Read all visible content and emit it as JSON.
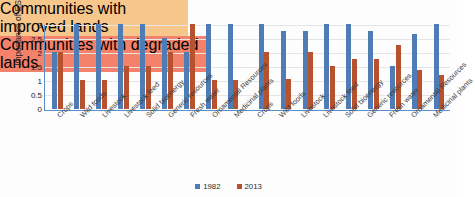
{
  "chart_data": {
    "type": "bar",
    "title": "",
    "xlabel": "",
    "ylabel": "Importance of ES",
    "ylim": [
      0,
      3
    ],
    "yticks": [
      "0",
      "0.5",
      "1",
      "1.5",
      "2",
      "2.5",
      "3"
    ],
    "grid": true,
    "legend_position": "bottom-center",
    "legend": [
      {
        "name": "1982",
        "color": "#4f7cb4"
      },
      {
        "name": "2013",
        "color": "#b7522e"
      }
    ],
    "panels": [
      {
        "banner": "Communities with improved lands",
        "banner_color": "#f7c68a",
        "categories": [
          "Crops",
          "Wild foods",
          "Livestock",
          "Livestock feed",
          "Solid bioenergy",
          "Generic resources",
          "Fresh water",
          "Ornamental Resources",
          "Medicinal plants"
        ],
        "series": [
          {
            "name": "1982",
            "values": [
              2,
              3,
              3,
              3,
              3,
              2.5,
              2,
              3,
              3
            ]
          },
          {
            "name": "2013",
            "values": [
              2,
              1,
              1,
              1.5,
              1.5,
              2,
              3,
              1,
              1
            ]
          }
        ]
      },
      {
        "banner": "Communities with degraded lands",
        "banner_color": "#f4816a",
        "categories": [
          "Crops",
          "Wild foods",
          "Livestock",
          "Livestock feed",
          "Solid bioenergy",
          "Generic resources",
          "Fresh water",
          "Ornamental Resources",
          "Medicinal plants"
        ],
        "series": [
          {
            "name": "1982",
            "values": [
              3,
              2.75,
              2.75,
              3,
              3,
              2.75,
              1.5,
              2.65,
              3
            ]
          },
          {
            "name": "2013",
            "values": [
              2,
              1.05,
              2,
              1.5,
              1.75,
              1.75,
              2.25,
              1.35,
              1.2
            ]
          }
        ]
      }
    ]
  },
  "colors": {
    "series_1982": "#4f7cb4",
    "series_2013": "#b7522e",
    "axis": "#5b8fc9",
    "grid": "#e6e6e6",
    "banner_improved": "#f7c68a",
    "banner_degraded": "#f4816a",
    "background": "#ffffff"
  }
}
